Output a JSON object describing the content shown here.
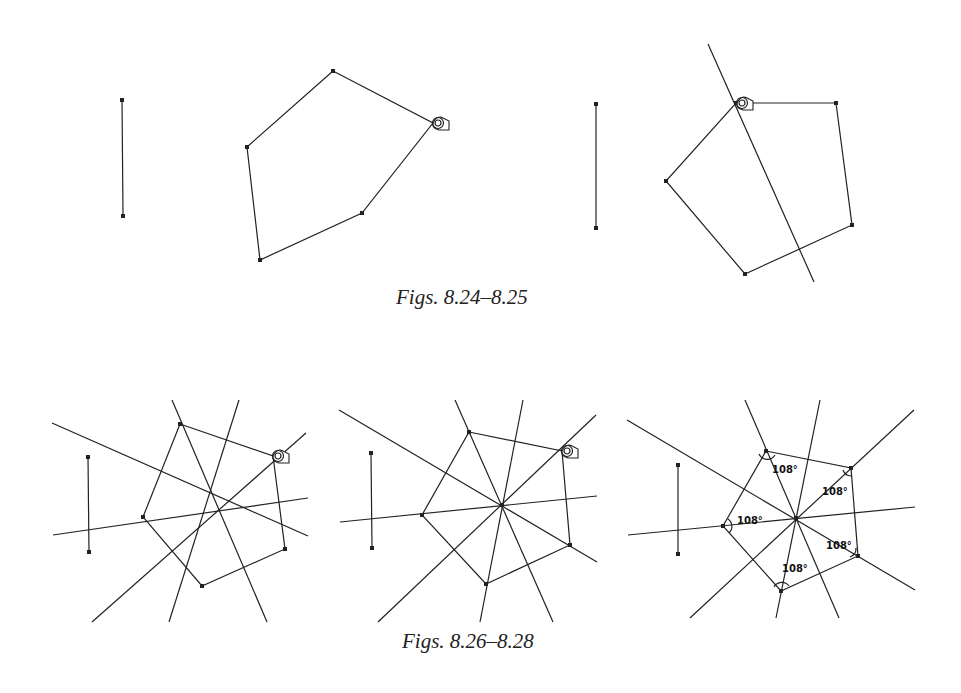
{
  "captions": {
    "top": "Figs. 8.24–8.25",
    "bottom": "Figs. 8.26–8.28"
  },
  "angle_labels": [
    "108°",
    "108°",
    "108°",
    "108°",
    "108°"
  ],
  "colors": {
    "ink": "#222222",
    "paper": "#ffffff"
  }
}
